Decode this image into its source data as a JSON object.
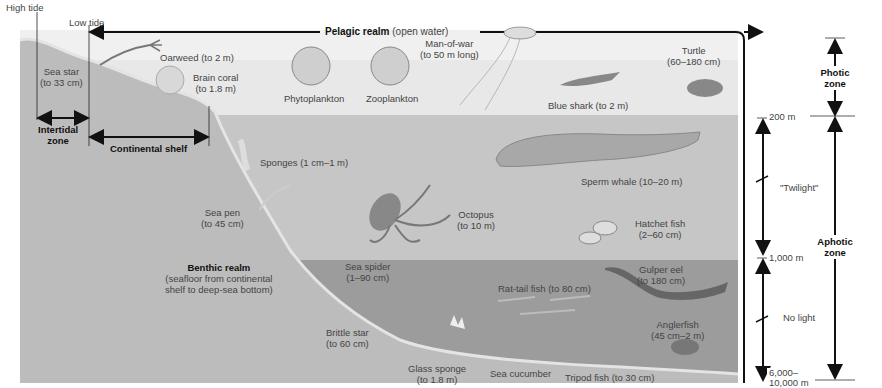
{
  "tides": {
    "high_tide": "High tide",
    "low_tide": "Low tide"
  },
  "realms": {
    "pelagic": {
      "name": "Pelagic realm",
      "note": "(open water)"
    },
    "benthic": {
      "name": "Benthic realm",
      "note_line1": "(seafloor from continental",
      "note_line2": "shelf to deep-sea bottom)"
    }
  },
  "zones": {
    "intertidal": {
      "line1": "Intertidal",
      "line2": "zone"
    },
    "continental_shelf": "Continental shelf",
    "photic": {
      "line1": "Photic",
      "line2": "zone"
    },
    "aphotic": {
      "line1": "Aphotic",
      "line2": "zone"
    }
  },
  "depths": {
    "d200": "200 m",
    "d1000": "1,000 m",
    "dmax_line1": "6,000–",
    "dmax_line2": "10,000 m"
  },
  "light_levels": {
    "twilight": "\"Twilight\"",
    "no_light": "No light"
  },
  "organisms": [
    {
      "name": "Sea star",
      "size": "(to 33 cm)"
    },
    {
      "name": "Oarweed (to 2 m)",
      "size": ""
    },
    {
      "name": "Brain coral",
      "size": "(to 1.8 m)"
    },
    {
      "name": "Phytoplankton",
      "size": ""
    },
    {
      "name": "Zooplankton",
      "size": ""
    },
    {
      "name": "Man-of-war",
      "size": "(to 50 m long)"
    },
    {
      "name": "Turtle",
      "size": "(60–180 cm)"
    },
    {
      "name": "Blue shark (to 2 m)",
      "size": ""
    },
    {
      "name": "Sponges (1 cm–1 m)",
      "size": ""
    },
    {
      "name": "Sperm whale (10–20 m)",
      "size": ""
    },
    {
      "name": "Sea pen",
      "size": "(to 45 cm)"
    },
    {
      "name": "Octopus",
      "size": "(to 10 m)"
    },
    {
      "name": "Hatchet fish",
      "size": "(2–60 cm)"
    },
    {
      "name": "Sea spider",
      "size": "(1–90 cm)"
    },
    {
      "name": "Gulper eel",
      "size": "(to 180 cm)"
    },
    {
      "name": "Rat-tail fish (to 80 cm)",
      "size": ""
    },
    {
      "name": "Anglerfish",
      "size": "(45 cm–2 m)"
    },
    {
      "name": "Brittle star",
      "size": "(to 60 cm)"
    },
    {
      "name": "Glass sponge",
      "size": "(to 1.8 m)"
    },
    {
      "name": "Sea cucumber",
      "size": ""
    },
    {
      "name": "Tripod fish (to 30 cm)",
      "size": ""
    }
  ],
  "colors": {
    "surface_water": "#e6e6e6",
    "twilight_water": "#c4c4c4",
    "deep_water": "#9a9a9a",
    "seafloor": "#bdbdbd",
    "ink": "#111111"
  }
}
